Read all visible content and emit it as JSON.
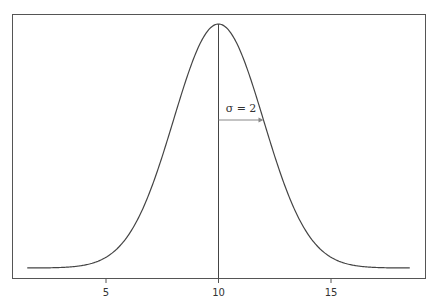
{
  "chart_data": {
    "type": "line",
    "title": "",
    "xlabel": "",
    "ylabel": "",
    "series": [
      {
        "name": "Normal PDF (mean 10, sd 2)",
        "mean": 10,
        "sd": 2,
        "x_start": 1.5,
        "x_end": 18.5
      }
    ],
    "x_ticks": [
      5,
      10,
      15
    ],
    "x_tick_labels": [
      "5",
      "10",
      "15"
    ],
    "xlim": [
      0.5,
      18.9
    ],
    "y_ticks": [],
    "grid": false,
    "annotations": [
      {
        "type": "vline",
        "x": 10,
        "label": ""
      },
      {
        "type": "arrow",
        "from_x": 10,
        "to_x": 12,
        "label": "σ = 2"
      }
    ],
    "legend": null
  }
}
